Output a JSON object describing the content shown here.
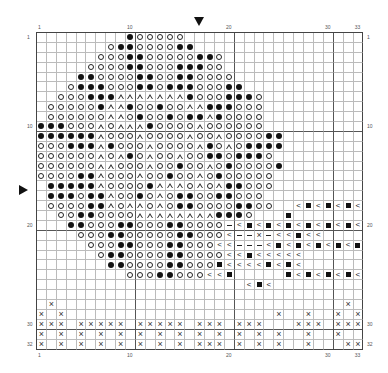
{
  "chart": {
    "title": "",
    "columns": 33,
    "rows": 32,
    "legend_symbols": {
      "o": "open-circle",
      "b": "filled-circle",
      "t": "open-triangle",
      "s": "filled-square",
      "l": "less-than",
      "d": "dash",
      "x": "cross",
      ".": "empty"
    },
    "grid_rows": [
      ".........booooo..................",
      ".......obboooobb.................",
      "......ooobbooooobbo..............",
      ".....oooobbooobbboo..............",
      "....bboooobboobboooo.............",
      "...obbbooobbobbbooobb............",
      "..ooobbbtttttttbooobbbo..........",
      ".ooooobttbooboottbbbooo..........",
      ".oooooottoboobobbtboooo..........",
      "bbbooototttbooootoooooo..........",
      "bbbbbbtoootooootootoooobb........",
      "ooobbbtboootooootbotobbbb........",
      "oooooototbotootoobbobbbo.........",
      "oooooottoootoobootoboooob........",
      "oooobbtoootoobootobooooo.........",
      ".bbbbbtoooobtttototbbooo.........",
      ".bbbobbtoobotobboobbooo..........",
      ".oooobbtottotobboooobboo..lslslsls",
      "..oobboooottttttttbbbo...s........",
      "...bbooobbooobboooodlslslslslslsl",
      "....ooobbooooobbooolddxdllsll......",
      ".....ooobbooobbooolldddlslslslsls",
      "......obboooobboooollslllll.......",
      ".......bboooobbooosllllslsl.......",
      ".........ooobbooolls.....slslslsl",
      ".....................lsl.........",
      ".................................",
      ".x.............................x.",
      "x.x.....................x..x..x.x",
      "xxx.xxxxx.xxxxx.xxx.xxx...xxx.xxx",
      "x.x.x.x.x.x.x.x.x.x.x.x.x..x..x..",
      "x.x.x.x.x.x.x.x.xxx.x.x.x..x...xx"
    ],
    "column_labels": [
      {
        "col": 1,
        "text": "1"
      },
      {
        "col": 10,
        "text": "10"
      },
      {
        "col": 20,
        "text": "20"
      },
      {
        "col": 30,
        "text": "30"
      },
      {
        "col": 33,
        "text": "33"
      }
    ],
    "row_labels": [
      {
        "row": 1,
        "text": "1"
      },
      {
        "row": 10,
        "text": "10"
      },
      {
        "row": 20,
        "text": "20"
      },
      {
        "row": 30,
        "text": "30"
      },
      {
        "row": 32,
        "text": "32"
      }
    ],
    "markers": {
      "top_column": 17,
      "left_row": 17
    }
  }
}
